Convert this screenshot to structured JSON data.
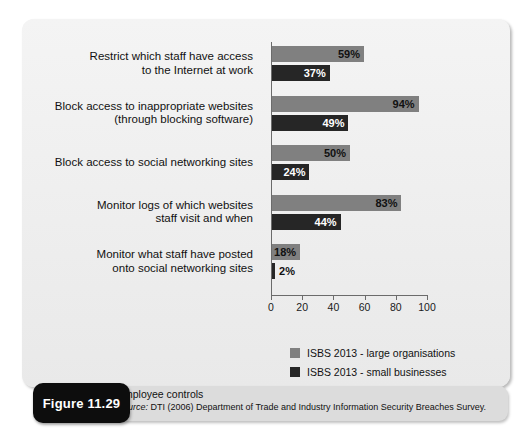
{
  "figure": {
    "badge": "Figure 11.29",
    "title": "Employee controls",
    "source_prefix": "Source:",
    "source_text": " DTI (2006) Department of Trade and Industry Information Security Breaches Survey."
  },
  "colors": {
    "large": "#808080",
    "small": "#262626",
    "panel_background": "#f0f0f0",
    "axis": "#6b6b6b",
    "badge_background": "#0d0d0d",
    "caption_background": "#dcdcdc"
  },
  "chart_data": {
    "type": "bar",
    "orientation": "horizontal",
    "title": "Employee controls",
    "xlabel": "",
    "ylabel": "",
    "xlim": [
      0,
      100
    ],
    "ticks": [
      0,
      20,
      40,
      60,
      80,
      100
    ],
    "grid": false,
    "legend_position": "bottom-left",
    "value_suffix": "%",
    "categories": [
      "Restrict which staff have access to the Internet at work",
      "Block access to inappropriate websites (through blocking software)",
      "Block access to social networking sites",
      "Monitor logs of which websites staff visit and when",
      "Monitor what staff have posted onto social networking sites"
    ],
    "category_lines": [
      [
        "Restrict which staff have access",
        "to the Internet at work"
      ],
      [
        "Block access to inappropriate websites",
        "(through blocking software)"
      ],
      [
        "Block access to social networking sites"
      ],
      [
        "Monitor logs of which websites",
        "staff visit and when"
      ],
      [
        "Monitor what staff have posted",
        "onto social networking sites"
      ]
    ],
    "series": [
      {
        "name": "ISBS 2013 - large organisations",
        "color": "#808080",
        "values": [
          59,
          94,
          50,
          83,
          18
        ],
        "labels": [
          "59%",
          "94%",
          "50%",
          "83%",
          "18%"
        ]
      },
      {
        "name": "ISBS 2013 - small businesses",
        "color": "#262626",
        "values": [
          37,
          49,
          24,
          44,
          2
        ],
        "labels": [
          "37%",
          "49%",
          "24%",
          "44%",
          "2%"
        ]
      }
    ]
  }
}
